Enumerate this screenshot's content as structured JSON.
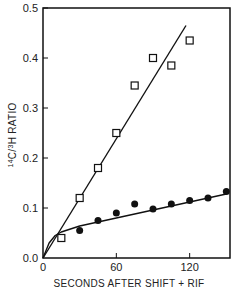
{
  "chart_data": {
    "type": "scatter",
    "title": "",
    "xlabel": "SECONDS AFTER SHIFT + RIF",
    "ylabel": "14C/3H RATIO",
    "ylabel_parts": {
      "sup1": "14",
      "mid": "C/",
      "sup2": "3",
      "rest": "H RATIO"
    },
    "xlim": [
      0,
      153
    ],
    "ylim": [
      0,
      0.5
    ],
    "xticks": [
      0,
      60,
      120
    ],
    "xtick_labels": [
      "0",
      "60",
      "120"
    ],
    "yticks": [
      0.0,
      0.1,
      0.2,
      0.3,
      0.4,
      0.5
    ],
    "ytick_labels": [
      "0.0",
      "0.1",
      "0.2",
      "0.3",
      "0.4",
      "0.5"
    ],
    "grid": false,
    "legend": "none",
    "series": [
      {
        "name": "open squares",
        "marker": "open-square",
        "x": [
          15,
          30,
          45,
          60,
          75,
          90,
          105,
          120
        ],
        "y": [
          0.04,
          0.12,
          0.18,
          0.25,
          0.345,
          0.4,
          0.385,
          0.435
        ],
        "fit_line": {
          "x": [
            0,
            117
          ],
          "y": [
            0.0,
            0.465
          ]
        }
      },
      {
        "name": "filled circles",
        "marker": "filled-circle",
        "x": [
          30,
          45,
          60,
          75,
          90,
          105,
          120,
          135,
          150
        ],
        "y": [
          0.055,
          0.075,
          0.09,
          0.108,
          0.098,
          0.108,
          0.115,
          0.12,
          0.133
        ],
        "fit_curve": {
          "x": [
            0,
            5,
            10,
            15,
            30,
            60,
            90,
            120,
            150
          ],
          "y": [
            0.0,
            0.03,
            0.045,
            0.052,
            0.064,
            0.08,
            0.096,
            0.112,
            0.128
          ]
        }
      }
    ],
    "colors": {
      "ink": "#111111",
      "background": "#ffffff"
    }
  }
}
